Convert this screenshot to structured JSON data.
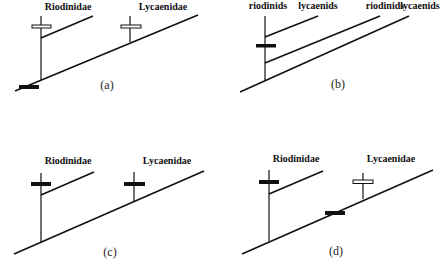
{
  "figure": {
    "panels": [
      {
        "id": "a",
        "caption": "(a)",
        "taxa": [
          "Riodinidae",
          "Lycaenidae"
        ],
        "character_marks": [
          {
            "location": "Riodinidae stem",
            "type": "open"
          },
          {
            "location": "Lycaenidae stem",
            "type": "open"
          },
          {
            "location": "root",
            "type": "solid"
          }
        ]
      },
      {
        "id": "b",
        "caption": "(b)",
        "taxa": [
          "riodinids",
          "lycaenids",
          "riodinids",
          "lycaenids"
        ],
        "character_marks": [
          {
            "location": "basal node above first split",
            "type": "solid"
          }
        ]
      },
      {
        "id": "c",
        "caption": "(c)",
        "taxa": [
          "Riodinidae",
          "Lycaenidae"
        ],
        "character_marks": [
          {
            "location": "Riodinidae stem",
            "type": "solid"
          },
          {
            "location": "Lycaenidae stem",
            "type": "solid"
          }
        ]
      },
      {
        "id": "d",
        "caption": "(d)",
        "taxa": [
          "Riodinidae",
          "Lycaenidae"
        ],
        "character_marks": [
          {
            "location": "Riodinidae stem",
            "type": "solid"
          },
          {
            "location": "Lycaenidae stem",
            "type": "open"
          },
          {
            "location": "internode on main lineage",
            "type": "solid"
          }
        ]
      }
    ]
  }
}
